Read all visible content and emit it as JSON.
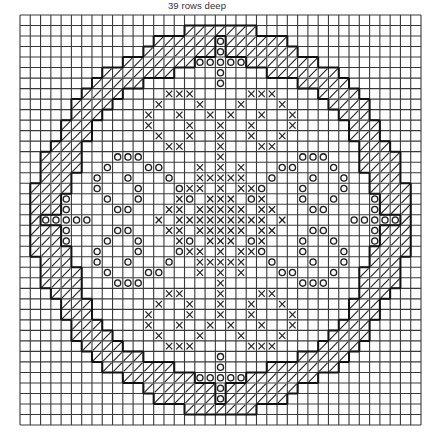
{
  "caption": "39 rows deep",
  "grid": {
    "rows": 39,
    "cols": 39,
    "width_px": 401,
    "height_px": 410,
    "line_color": "#3a3a3a",
    "outline_color": "#111111"
  },
  "legend_symbols": {
    "hatch": "diagonal-hatch-stitch",
    "cross": "cross-stitch-x",
    "circle": "circle-stitch-o"
  },
  "ring_top_left": [
    {
      "row": 1,
      "outer": 17,
      "inner": 19
    },
    {
      "row": 2,
      "outer": 14,
      "inner": 18
    },
    {
      "row": 3,
      "outer": 12,
      "inner": 18
    },
    {
      "row": 4,
      "outer": 10,
      "inner": 16
    },
    {
      "row": 5,
      "outer": 9,
      "inner": 13
    },
    {
      "row": 6,
      "outer": 7,
      "inner": 10
    },
    {
      "row": 7,
      "outer": 6,
      "inner": 9
    },
    {
      "row": 8,
      "outer": 5,
      "inner": 8
    },
    {
      "row": 9,
      "outer": 5,
      "inner": 7
    },
    {
      "row": 10,
      "outer": 4,
      "inner": 6
    },
    {
      "row": 11,
      "outer": 4,
      "inner": 6
    },
    {
      "row": 12,
      "outer": 3,
      "inner": 5
    },
    {
      "row": 13,
      "outer": 2,
      "inner": 5
    },
    {
      "row": 14,
      "outer": 2,
      "inner": 5
    },
    {
      "row": 15,
      "outer": 2,
      "inner": 4
    },
    {
      "row": 16,
      "outer": 1,
      "inner": 3
    },
    {
      "row": 17,
      "outer": 1,
      "inner": 3
    },
    {
      "row": 18,
      "outer": 1,
      "inner": 3
    },
    {
      "row": 19,
      "outer": 1,
      "inner": 1
    }
  ],
  "circles_top_left": [
    [
      2,
      19
    ],
    [
      3,
      19
    ],
    [
      4,
      17
    ],
    [
      4,
      18
    ],
    [
      4,
      19
    ],
    [
      5,
      19
    ],
    [
      6,
      19
    ],
    [
      13,
      9
    ],
    [
      13,
      10
    ],
    [
      13,
      11
    ],
    [
      14,
      8
    ],
    [
      14,
      12
    ],
    [
      14,
      13
    ],
    [
      15,
      7
    ],
    [
      15,
      10
    ],
    [
      15,
      14
    ],
    [
      16,
      7
    ],
    [
      16,
      11
    ],
    [
      16,
      15
    ],
    [
      17,
      8
    ],
    [
      17,
      11
    ],
    [
      17,
      16
    ],
    [
      18,
      9
    ],
    [
      18,
      10
    ],
    [
      17,
      4
    ],
    [
      18,
      4
    ],
    [
      19,
      2
    ],
    [
      19,
      3
    ],
    [
      19,
      4
    ],
    [
      19,
      5
    ],
    [
      19,
      6
    ]
  ],
  "crosses_top_left": [
    [
      7,
      14
    ],
    [
      7,
      15
    ],
    [
      7,
      16
    ],
    [
      8,
      13
    ],
    [
      8,
      17
    ],
    [
      9,
      12
    ],
    [
      9,
      15
    ],
    [
      9,
      18
    ],
    [
      10,
      12
    ],
    [
      10,
      16
    ],
    [
      10,
      19
    ],
    [
      11,
      13
    ],
    [
      11,
      16
    ],
    [
      11,
      19
    ],
    [
      12,
      14
    ],
    [
      12,
      15
    ],
    [
      12,
      19
    ],
    [
      13,
      19
    ],
    [
      14,
      19
    ],
    [
      15,
      19
    ],
    [
      14,
      17
    ],
    [
      15,
      17
    ],
    [
      15,
      18
    ],
    [
      16,
      16
    ],
    [
      16,
      17
    ],
    [
      17,
      15
    ],
    [
      17,
      18
    ],
    [
      17,
      19
    ],
    [
      18,
      14
    ],
    [
      18,
      15
    ],
    [
      18,
      17
    ],
    [
      18,
      18
    ],
    [
      19,
      13
    ],
    [
      19,
      15
    ],
    [
      19,
      16
    ],
    [
      19,
      17
    ],
    [
      19,
      18
    ],
    [
      19,
      19
    ],
    [
      16,
      19
    ],
    [
      18,
      19
    ]
  ]
}
